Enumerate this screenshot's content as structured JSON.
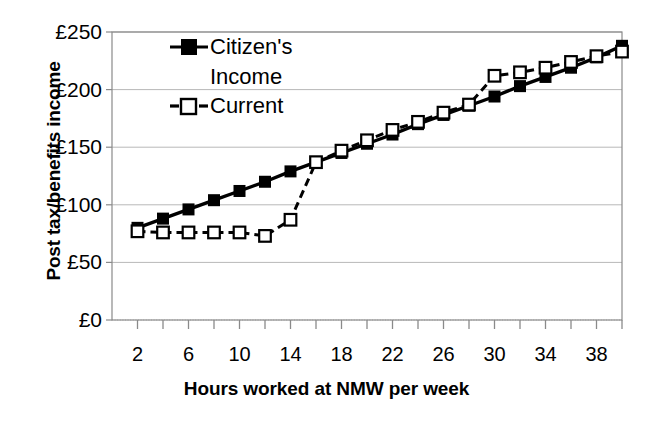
{
  "chart_data": {
    "type": "line",
    "title": "",
    "xlabel": "Hours worked at NMW per week",
    "ylabel": "Post tax/benefits income",
    "xlim": [
      0,
      40
    ],
    "ylim": [
      0,
      250
    ],
    "grid": true,
    "legend_position": "top-left inside plot",
    "x_ticks": [
      2,
      6,
      10,
      14,
      18,
      22,
      26,
      30,
      34,
      38
    ],
    "x_tick_labels": [
      "2",
      "6",
      "10",
      "14",
      "18",
      "22",
      "26",
      "30",
      "34",
      "38"
    ],
    "x_minor_tick_step": 2,
    "y_ticks": [
      0,
      50,
      100,
      150,
      200,
      250
    ],
    "y_tick_labels": [
      "£0",
      "£50",
      "£100",
      "£150",
      "£200",
      "£250"
    ],
    "currency_symbol": "£",
    "x": [
      2,
      4,
      6,
      8,
      10,
      12,
      14,
      16,
      18,
      20,
      22,
      24,
      26,
      28,
      30,
      32,
      34,
      36,
      38,
      40
    ],
    "series": [
      {
        "name": "Citizen's Income",
        "marker": "filled-square",
        "line_style": "solid",
        "color": "#000000",
        "values": [
          80,
          88,
          96,
          104,
          112,
          120,
          129,
          137,
          145,
          153,
          161,
          170,
          178,
          186,
          194,
          203,
          211,
          219,
          228,
          238
        ]
      },
      {
        "name": "Current",
        "marker": "open-square",
        "line_style": "dashed",
        "color": "#000000",
        "values": [
          77,
          76,
          76,
          76,
          76,
          73,
          87,
          137,
          147,
          156,
          165,
          172,
          180,
          187,
          212,
          215,
          219,
          224,
          229,
          233
        ]
      }
    ],
    "annotations": []
  },
  "legend": {
    "entries": [
      {
        "label_line1": "Citizen's",
        "label_line2": "Income",
        "marker": "filled-square"
      },
      {
        "label_line1": "Current",
        "label_line2": "",
        "marker": "open-square"
      }
    ]
  },
  "axes": {
    "y_title": "Post tax/benefits income",
    "x_title": "Hours worked at NMW per week"
  },
  "colors": {
    "background": "#ffffff",
    "foreground": "#000000",
    "gridline": "#b8b8b8",
    "frame": "#8a8a8a"
  }
}
